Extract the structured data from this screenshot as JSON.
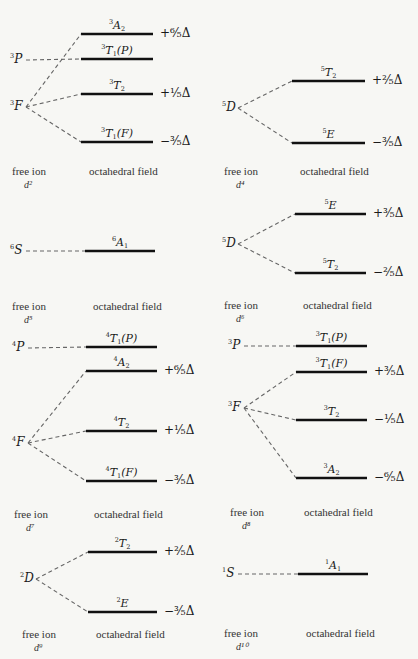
{
  "captions": {
    "free_ion": "free ion",
    "octahedral_field": "octahedral field"
  },
  "panels": [
    {
      "id": "d2",
      "config": "d²",
      "free_ion_terms": [
        {
          "mult": "3",
          "L": "P"
        },
        {
          "mult": "3",
          "L": "F"
        }
      ],
      "levels": [
        {
          "mult": "3",
          "sym": "A",
          "sub": "2",
          "paren": "",
          "energy": "+⁶⁄₅Δ"
        },
        {
          "mult": "3",
          "sym": "T",
          "sub": "1",
          "paren": "(P)",
          "energy": ""
        },
        {
          "mult": "3",
          "sym": "T",
          "sub": "2",
          "paren": "",
          "energy": "+¹⁄₅Δ"
        },
        {
          "mult": "3",
          "sym": "T",
          "sub": "1",
          "paren": "(F)",
          "energy": "−³⁄₅Δ"
        }
      ]
    },
    {
      "id": "d4",
      "config": "d⁴",
      "free_ion_terms": [
        {
          "mult": "5",
          "L": "D"
        }
      ],
      "levels": [
        {
          "mult": "5",
          "sym": "T",
          "sub": "2",
          "paren": "",
          "energy": "+²⁄₅Δ"
        },
        {
          "mult": "5",
          "sym": "E",
          "sub": "",
          "paren": "",
          "energy": "−³⁄₅Δ"
        }
      ]
    },
    {
      "id": "d5",
      "config": "d⁵",
      "free_ion_terms": [
        {
          "mult": "6",
          "L": "S"
        }
      ],
      "levels": [
        {
          "mult": "6",
          "sym": "A",
          "sub": "1",
          "paren": "",
          "energy": ""
        }
      ]
    },
    {
      "id": "d6",
      "config": "d⁶",
      "free_ion_terms": [
        {
          "mult": "5",
          "L": "D"
        }
      ],
      "levels": [
        {
          "mult": "5",
          "sym": "E",
          "sub": "",
          "paren": "",
          "energy": "+³⁄₅Δ"
        },
        {
          "mult": "5",
          "sym": "T",
          "sub": "2",
          "paren": "",
          "energy": "−²⁄₅Δ"
        }
      ]
    },
    {
      "id": "d7",
      "config": "d⁷",
      "free_ion_terms": [
        {
          "mult": "4",
          "L": "P"
        },
        {
          "mult": "4",
          "L": "F"
        }
      ],
      "levels": [
        {
          "mult": "4",
          "sym": "T",
          "sub": "1",
          "paren": "(P)",
          "energy": ""
        },
        {
          "mult": "4",
          "sym": "A",
          "sub": "2",
          "paren": "",
          "energy": "+⁶⁄₅Δ"
        },
        {
          "mult": "4",
          "sym": "T",
          "sub": "2",
          "paren": "",
          "energy": "+¹⁄₅Δ"
        },
        {
          "mult": "4",
          "sym": "T",
          "sub": "1",
          "paren": "(F)",
          "energy": "−³⁄₅Δ"
        }
      ]
    },
    {
      "id": "d8",
      "config": "d⁸",
      "free_ion_terms": [
        {
          "mult": "3",
          "L": "P"
        },
        {
          "mult": "3",
          "L": "F"
        }
      ],
      "levels": [
        {
          "mult": "3",
          "sym": "T",
          "sub": "1",
          "paren": "(P)",
          "energy": ""
        },
        {
          "mult": "3",
          "sym": "T",
          "sub": "1",
          "paren": "(F)",
          "energy": "+³⁄₅Δ"
        },
        {
          "mult": "3",
          "sym": "T",
          "sub": "2",
          "paren": "",
          "energy": "−¹⁄₅Δ"
        },
        {
          "mult": "3",
          "sym": "A",
          "sub": "2",
          "paren": "",
          "energy": "−⁶⁄₅Δ"
        }
      ]
    },
    {
      "id": "d9",
      "config": "d⁹",
      "free_ion_terms": [
        {
          "mult": "2",
          "L": "D"
        }
      ],
      "levels": [
        {
          "mult": "2",
          "sym": "T",
          "sub": "2",
          "paren": "",
          "energy": "+²⁄₅Δ"
        },
        {
          "mult": "2",
          "sym": "E",
          "sub": "",
          "paren": "",
          "energy": "−³⁄₅Δ"
        }
      ]
    },
    {
      "id": "d10",
      "config": "d¹⁰",
      "free_ion_terms": [
        {
          "mult": "1",
          "L": "S"
        }
      ],
      "levels": [
        {
          "mult": "1",
          "sym": "A",
          "sub": "1",
          "paren": "",
          "energy": ""
        }
      ]
    }
  ],
  "layout": {
    "d2": {
      "termPos": [
        [
          20,
          60
        ],
        [
          20,
          107
        ]
      ],
      "lineX": [
        81,
        153
      ],
      "levelY": [
        34,
        59,
        94,
        142
      ],
      "conn": [
        [
          1,
          [
            0,
            2,
            3
          ]
        ],
        [
          0,
          [
            1
          ]
        ]
      ],
      "capY": 166
    },
    "d4": {
      "termPos": [
        [
          232,
          108
        ]
      ],
      "lineX": [
        292,
        365
      ],
      "levelY": [
        81,
        143
      ],
      "conn": [
        [
          0,
          [
            0,
            1
          ]
        ]
      ],
      "capY": 166
    },
    "d5": {
      "termPos": [
        [
          20,
          251
        ]
      ],
      "lineX": [
        85,
        155
      ],
      "levelY": [
        251
      ],
      "conn": [
        [
          0,
          [
            0
          ]
        ]
      ],
      "capY": 301
    },
    "d6": {
      "termPos": [
        [
          232,
          244
        ]
      ],
      "lineX": [
        295,
        366
      ],
      "levelY": [
        214,
        273
      ],
      "conn": [
        [
          0,
          [
            0,
            1
          ]
        ]
      ],
      "capY": 300
    },
    "d7": {
      "termPos": [
        [
          22,
          348
        ],
        [
          22,
          443
        ]
      ],
      "lineX": [
        86,
        157
      ],
      "levelY": [
        347,
        371,
        431,
        481
      ],
      "conn": [
        [
          0,
          [
            0
          ]
        ],
        [
          1,
          [
            1,
            2,
            3
          ]
        ]
      ],
      "capY": 509
    },
    "d8": {
      "termPos": [
        [
          238,
          346
        ],
        [
          238,
          408
        ]
      ],
      "lineX": [
        296,
        367
      ],
      "levelY": [
        346,
        372,
        420,
        478
      ],
      "conn": [
        [
          0,
          [
            0
          ]
        ],
        [
          1,
          [
            1,
            2,
            3
          ]
        ]
      ],
      "capY": 507
    },
    "d9": {
      "termPos": [
        [
          30,
          579
        ]
      ],
      "lineX": [
        88,
        157
      ],
      "levelY": [
        552,
        612
      ],
      "conn": [
        [
          0,
          [
            0,
            1
          ]
        ]
      ],
      "capY": 629
    },
    "d10": {
      "termPos": [
        [
          232,
          574
        ]
      ],
      "lineX": [
        298,
        368
      ],
      "levelY": [
        574
      ],
      "conn": [
        [
          0,
          [
            0
          ]
        ]
      ],
      "capY": 628
    }
  },
  "colors": {
    "background": "#f7f7f4",
    "ink": "#111111",
    "dash": "#666666"
  }
}
